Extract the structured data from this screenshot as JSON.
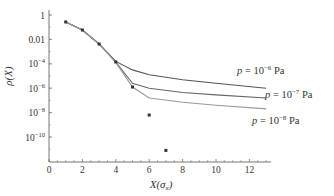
{
  "chart_data": {
    "type": "line",
    "title": "",
    "xlabel": "X(σ_x)",
    "ylabel": "ρ(X)",
    "xlim": [
      0,
      13.3
    ],
    "ylim_log10": [
      -11.5,
      0.3
    ],
    "yscale": "log",
    "grid": false,
    "x_ticks": [
      0,
      2,
      4,
      6,
      8,
      10,
      12
    ],
    "x_tick_labels": [
      "0",
      "2",
      "4",
      "6",
      "8",
      "10",
      "12"
    ],
    "y_ticks_log10": [
      0,
      -2,
      -4,
      -6,
      -8,
      -10
    ],
    "y_tick_labels": [
      {
        "base": "1",
        "exp": ""
      },
      {
        "base": "0.01",
        "exp": ""
      },
      {
        "base": "10",
        "exp": "−4"
      },
      {
        "base": "10",
        "exp": "−6"
      },
      {
        "base": "10",
        "exp": "−8"
      },
      {
        "base": "10",
        "exp": "−10"
      }
    ],
    "scatter": {
      "name": "data points",
      "x": [
        1,
        2,
        3,
        4,
        5,
        6,
        7
      ],
      "log10_y": [
        -0.57,
        -1.23,
        -2.38,
        -3.85,
        -5.9,
        -8.2,
        -11.1
      ]
    },
    "series": [
      {
        "name": "p = 10^-6 Pa",
        "label_base": "p = 10",
        "label_exp": "−6",
        "label_unit": " Pa",
        "color": "#555555",
        "x": [
          1,
          2,
          3,
          4,
          5,
          6,
          8,
          10,
          13
        ],
        "log10_y": [
          -0.57,
          -1.23,
          -2.38,
          -3.8,
          -4.5,
          -4.9,
          -5.3,
          -5.6,
          -6.0
        ]
      },
      {
        "name": "p = 10^-7 Pa",
        "label_base": "p = 10",
        "label_exp": "−7",
        "label_unit": " Pa",
        "color": "#666666",
        "x": [
          1,
          2,
          3,
          4,
          5,
          6,
          8,
          10,
          13
        ],
        "log10_y": [
          -0.57,
          -1.23,
          -2.38,
          -3.85,
          -5.6,
          -6.0,
          -6.35,
          -6.55,
          -6.8
        ]
      },
      {
        "name": "p = 10^-8 Pa",
        "label_base": "p = 10",
        "label_exp": "−8",
        "label_unit": " Pa",
        "color": "#999999",
        "x": [
          1,
          2,
          3,
          4,
          5,
          6,
          8,
          10,
          13
        ],
        "log10_y": [
          -0.57,
          -1.23,
          -2.38,
          -3.9,
          -5.9,
          -6.8,
          -7.15,
          -7.4,
          -7.7
        ]
      }
    ]
  }
}
